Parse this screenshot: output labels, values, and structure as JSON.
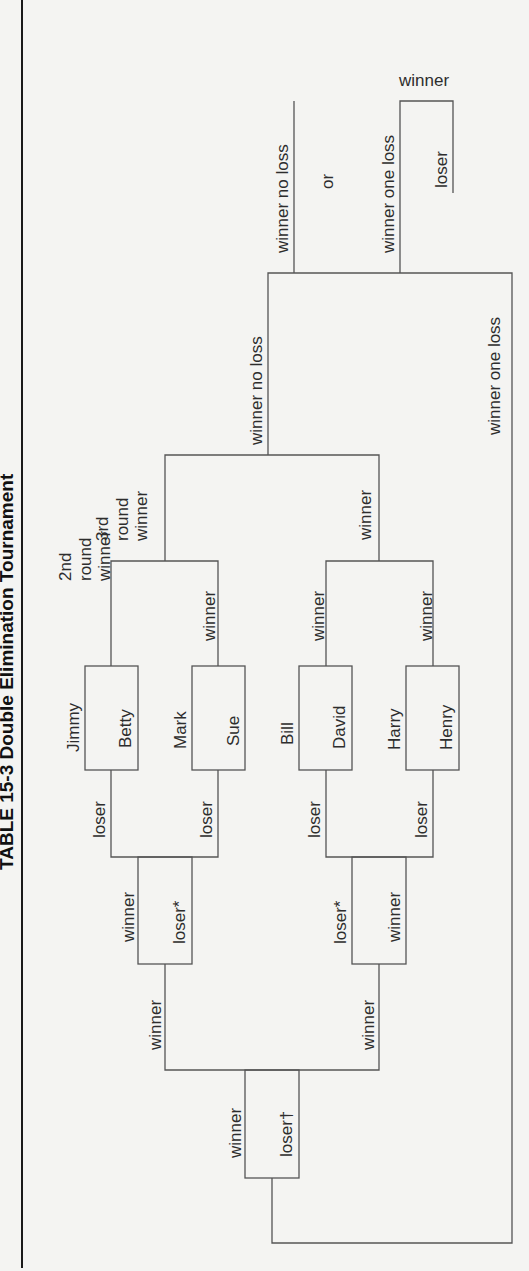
{
  "title": "TABLE 15-3  Double Elimination Tournament",
  "players": {
    "p1": "Jimmy",
    "p2": "Betty",
    "p3": "Mark",
    "p4": "Sue",
    "p5": "Bill",
    "p6": "David",
    "p7": "Harry",
    "p8": "Henry"
  },
  "labels": {
    "winner": "winner",
    "loser": "loser",
    "loser_star": "loser*",
    "loser_dagger": "loser†",
    "second_round_a": "2nd",
    "second_round_b": "round",
    "third_round_a": "3rd",
    "third_round_b": "round",
    "winner_no_loss": "winner no loss",
    "winner_one_loss": "winner one loss",
    "or": "or"
  },
  "colors": {
    "line": "#555555",
    "text": "#2d2d2d",
    "background": "#f4f4f2"
  }
}
